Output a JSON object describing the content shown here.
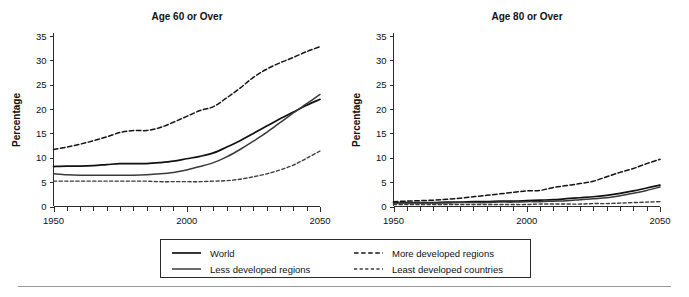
{
  "figure": {
    "background": "#ffffff",
    "ink_color": "#111111",
    "footer_rule": true
  },
  "chart_data": [
    {
      "type": "line",
      "title": "Age 60 or Over",
      "xlabel": "",
      "ylabel": "Percentage",
      "xlim": [
        1950,
        2050
      ],
      "ylim": [
        0,
        35
      ],
      "yticks": [
        0,
        5,
        10,
        15,
        20,
        25,
        30,
        35
      ],
      "xticks_major": [
        1950,
        2000,
        2050
      ],
      "xtick_labels": [
        "1950",
        "2000",
        "2050"
      ],
      "xticks_minor_step": 5,
      "grid": false,
      "legend_position": "below-center",
      "x": [
        1950,
        1955,
        1960,
        1965,
        1970,
        1975,
        1980,
        1985,
        1990,
        1995,
        2000,
        2005,
        2010,
        2015,
        2020,
        2025,
        2030,
        2035,
        2040,
        2045,
        2050
      ],
      "series": [
        {
          "name": "World",
          "style": "solid",
          "color": "#111111",
          "values": [
            8.2,
            8.3,
            8.3,
            8.4,
            8.6,
            8.8,
            8.8,
            8.8,
            9.0,
            9.3,
            9.8,
            10.3,
            11.0,
            12.2,
            13.5,
            15.0,
            16.5,
            18.0,
            19.4,
            20.8,
            22.0
          ]
        },
        {
          "name": "Less developed regions",
          "style": "solid",
          "color": "#3a3a3a",
          "values": [
            6.7,
            6.5,
            6.4,
            6.4,
            6.4,
            6.4,
            6.4,
            6.5,
            6.7,
            7.0,
            7.5,
            8.2,
            9.0,
            10.2,
            11.7,
            13.4,
            15.2,
            17.2,
            19.2,
            21.1,
            23.0
          ]
        },
        {
          "name": "More developed regions",
          "style": "dashed",
          "color": "#141414",
          "values": [
            11.7,
            12.2,
            12.8,
            13.5,
            14.3,
            15.2,
            15.6,
            15.6,
            16.2,
            17.3,
            18.5,
            19.7,
            20.5,
            22.3,
            24.3,
            26.5,
            28.2,
            29.5,
            30.6,
            31.8,
            32.8
          ]
        },
        {
          "name": "Least developed countries",
          "style": "dashed",
          "color": "#3d3d3d",
          "values": [
            5.2,
            5.2,
            5.2,
            5.2,
            5.2,
            5.2,
            5.2,
            5.2,
            5.1,
            5.1,
            5.1,
            5.1,
            5.2,
            5.3,
            5.6,
            6.1,
            6.7,
            7.5,
            8.5,
            9.9,
            11.4
          ]
        }
      ]
    },
    {
      "type": "line",
      "title": "Age 80 or Over",
      "xlabel": "",
      "ylabel": "Percentage",
      "xlim": [
        1950,
        2050
      ],
      "ylim": [
        0,
        35
      ],
      "yticks": [
        0,
        5,
        10,
        15,
        20,
        25,
        30,
        35
      ],
      "xticks_major": [
        1950,
        2000,
        2050
      ],
      "xtick_labels": [
        "1950",
        "2000",
        "2050"
      ],
      "xticks_minor_step": 5,
      "grid": false,
      "legend_position": "below-center",
      "x": [
        1950,
        1955,
        1960,
        1965,
        1970,
        1975,
        1980,
        1985,
        1990,
        1995,
        2000,
        2005,
        2010,
        2015,
        2020,
        2025,
        2030,
        2035,
        2040,
        2045,
        2050
      ],
      "series": [
        {
          "name": "World",
          "style": "solid",
          "color": "#111111",
          "values": [
            0.8,
            0.8,
            0.8,
            0.8,
            0.9,
            0.9,
            1.0,
            1.0,
            1.1,
            1.1,
            1.2,
            1.3,
            1.4,
            1.6,
            1.8,
            2.0,
            2.3,
            2.7,
            3.2,
            3.8,
            4.4
          ]
        },
        {
          "name": "Less developed regions",
          "style": "solid",
          "color": "#3a3a3a",
          "values": [
            0.7,
            0.7,
            0.7,
            0.7,
            0.7,
            0.8,
            0.8,
            0.8,
            0.9,
            0.9,
            1.0,
            1.0,
            1.1,
            1.2,
            1.4,
            1.6,
            1.8,
            2.2,
            2.7,
            3.3,
            4.0
          ]
        },
        {
          "name": "More developed regions",
          "style": "dashed",
          "color": "#141414",
          "values": [
            1.0,
            1.1,
            1.2,
            1.3,
            1.5,
            1.7,
            2.0,
            2.3,
            2.6,
            2.9,
            3.2,
            3.3,
            3.9,
            4.3,
            4.7,
            5.2,
            6.1,
            7.0,
            7.8,
            8.8,
            9.7
          ]
        },
        {
          "name": "Least developed countries",
          "style": "dashed",
          "color": "#3d3d3d",
          "values": [
            0.4,
            0.4,
            0.4,
            0.4,
            0.4,
            0.4,
            0.4,
            0.4,
            0.4,
            0.4,
            0.4,
            0.5,
            0.5,
            0.5,
            0.5,
            0.6,
            0.6,
            0.7,
            0.8,
            0.9,
            1.0
          ]
        }
      ]
    }
  ],
  "legend": {
    "entries": [
      {
        "label": "World",
        "style": "solid",
        "color": "#111111"
      },
      {
        "label": "More developed regions",
        "style": "dashed",
        "color": "#141414"
      },
      {
        "label": "Less developed regions",
        "style": "solid",
        "color": "#3a3a3a"
      },
      {
        "label": "Least developed countries",
        "style": "dashed",
        "color": "#3d3d3d"
      }
    ]
  }
}
